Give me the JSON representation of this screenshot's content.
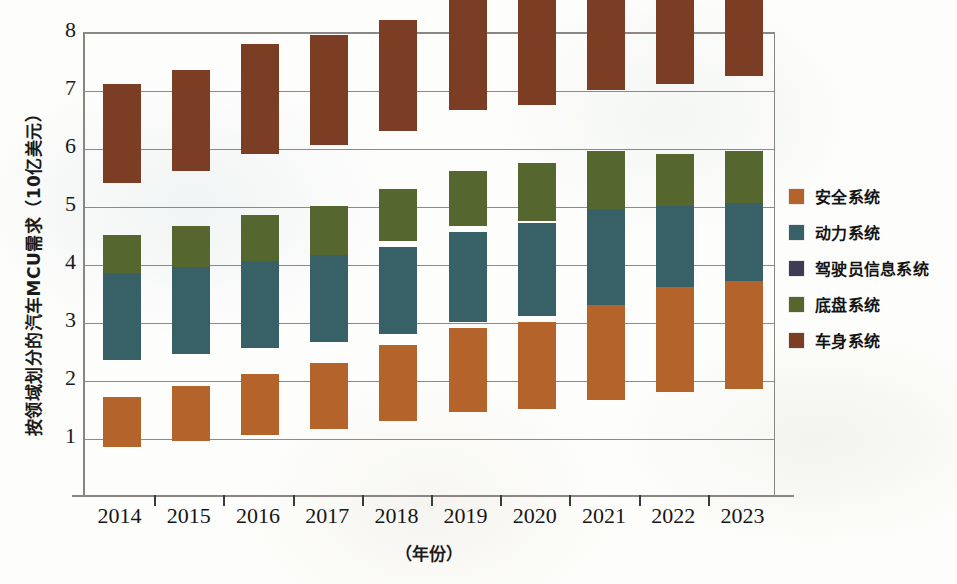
{
  "chart_data": {
    "type": "bar",
    "stacked": true,
    "title": "",
    "xlabel": "（年份）",
    "ylabel": "按领域划分的汽车MCU需求（10亿美元）",
    "categories": [
      "2014",
      "2015",
      "2016",
      "2017",
      "2018",
      "2019",
      "2020",
      "2021",
      "2022",
      "2023"
    ],
    "ylim": [
      0,
      8
    ],
    "yticks": [
      1,
      2,
      3,
      4,
      5,
      6,
      7,
      8
    ],
    "ytick_labels": [
      "1",
      "2",
      "3",
      "4",
      "5",
      "6",
      "7",
      "8"
    ],
    "grid": true,
    "legend_position": "right",
    "series": [
      {
        "name": "安全系统",
        "color": "#b4632b",
        "values": [
          0.85,
          0.95,
          1.05,
          1.15,
          1.3,
          1.45,
          1.5,
          1.65,
          1.8,
          1.85
        ]
      },
      {
        "name": "动力系统",
        "color": "#376166",
        "values": [
          1.5,
          1.5,
          1.5,
          1.5,
          1.5,
          1.55,
          1.6,
          1.65,
          1.6,
          1.6
        ]
      },
      {
        "name": "驾驶员信息系统",
        "color": "#413a56",
        "values": [
          0.55,
          0.6,
          0.6,
          0.65,
          0.7,
          0.7,
          0.65,
          0.65,
          0.7,
          0.7
        ]
      },
      {
        "name": "底盘系统",
        "color": "#55662f",
        "values": [
          0.8,
          0.8,
          0.85,
          0.85,
          0.9,
          0.95,
          1.0,
          1.0,
          0.9,
          0.9
        ]
      },
      {
        "name": "车身系统",
        "color": "#7b3d24",
        "values": [
          1.7,
          1.75,
          1.9,
          1.9,
          1.9,
          2.0,
          2.0,
          2.05,
          2.1,
          2.2
        ]
      }
    ],
    "totals": [
      5.4,
      5.6,
      5.9,
      6.05,
      6.3,
      6.65,
      6.75,
      7.0,
      7.1,
      7.25
    ]
  },
  "legend": {
    "items": [
      {
        "label": "安全系统",
        "color": "#b4632b"
      },
      {
        "label": "动力系统",
        "color": "#376166"
      },
      {
        "label": "驾驶员信息系统",
        "color": "#413a56"
      },
      {
        "label": "底盘系统",
        "color": "#55662f"
      },
      {
        "label": "车身系统",
        "color": "#7b3d24"
      }
    ]
  }
}
